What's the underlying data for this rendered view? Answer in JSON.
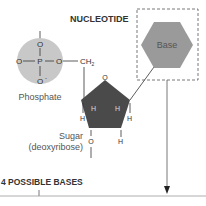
{
  "title": "NUCLEOTIDE",
  "phosphate": {
    "label": "Phosphate",
    "atoms": {
      "center": "P",
      "top": "O",
      "left": "O",
      "right": "O",
      "bottom": "O"
    },
    "charge_left": "-",
    "charge_bottom": "-",
    "fill": "#c8c8c8"
  },
  "ch2": {
    "c": "CH",
    "sub": "2"
  },
  "sugar": {
    "label": "Sugar",
    "sublabel": "(deoxyribose)",
    "ring_o": "O",
    "fill": "#4a4a4a",
    "atoms": {
      "c_left": "C",
      "c_right": "C",
      "c_bl": "C",
      "c_br": "C",
      "h": "H",
      "o_bottom": "O"
    }
  },
  "base": {
    "label": "Base",
    "fill": "#9a9a9a"
  },
  "footer": {
    "label": "4 POSSIBLE BASES"
  }
}
